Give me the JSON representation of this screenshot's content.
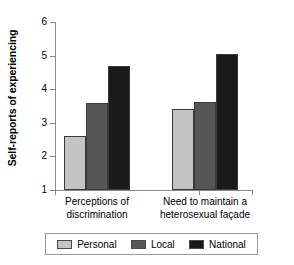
{
  "chart_data": {
    "type": "bar",
    "title": "",
    "xlabel": "",
    "ylabel": "Self-reports of experiencing",
    "ylim": [
      1,
      6
    ],
    "yticks": [
      1,
      2,
      3,
      4,
      5,
      6
    ],
    "ytick_labels": [
      "1",
      "2",
      "3",
      "4",
      "5",
      "6"
    ],
    "grid": false,
    "legend_position": "bottom",
    "categories": [
      "Perceptions of\ndiscrimination",
      "Need to maintain a\nheterosexual façade"
    ],
    "series": [
      {
        "name": "Personal",
        "color": "#c4c4c4",
        "values": [
          2.6,
          3.42
        ]
      },
      {
        "name": "Local",
        "color": "#565656",
        "values": [
          3.6,
          3.63
        ]
      },
      {
        "name": "National",
        "color": "#1a1a1a",
        "values": [
          4.7,
          5.05
        ]
      }
    ]
  },
  "axis": {
    "y_title": "Self-reports of experiencing"
  },
  "legend": {
    "items": [
      {
        "label": "Personal",
        "color": "#c4c4c4"
      },
      {
        "label": "Local",
        "color": "#565656"
      },
      {
        "label": "National",
        "color": "#1a1a1a"
      }
    ]
  },
  "colors": {
    "personal": "#c4c4c4",
    "local": "#565656",
    "national": "#1a1a1a",
    "axis": "#8a8a8a",
    "bar_outline": "#3a3a3a",
    "background": "#ffffff"
  }
}
